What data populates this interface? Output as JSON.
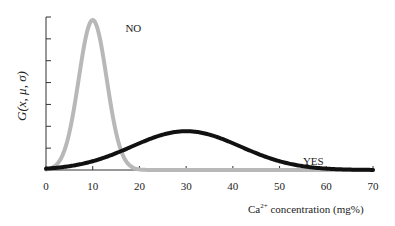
{
  "chart_data": {
    "type": "line",
    "title": "",
    "xlabel_base": "Ca",
    "xlabel_sup": "2+",
    "xlabel_rest": " concentration (mg%)",
    "ylabel": "G(x, μ, σ)",
    "xlim": [
      0,
      70
    ],
    "x_ticks": [
      0,
      10,
      20,
      30,
      40,
      50,
      60,
      70
    ],
    "y_tick_count": 7,
    "grid": false,
    "series": [
      {
        "name": "NO",
        "mu": 10,
        "sigma": 3.0,
        "color": "#b8b8b8",
        "label_x": 17,
        "label_rel_y": 0.92
      },
      {
        "name": "YES",
        "mu": 30,
        "sigma": 11.6,
        "color": "#111111",
        "label_x": 55,
        "label_rel_y": 0.12
      }
    ]
  }
}
